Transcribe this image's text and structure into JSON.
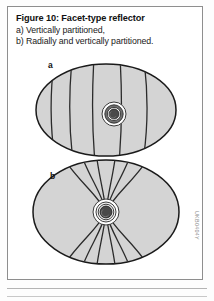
{
  "figure": {
    "title": "Figure 10: Facet-type reflector",
    "caption_lines": [
      "a) Vertically partitioned,",
      "b) Radially and vertically partitioned."
    ],
    "watermark_code": "UKB0404Y",
    "panels": [
      {
        "label": "a",
        "name": "vertically-partitioned-reflector",
        "description": "Elliptical dish reflector divided by vertical curved facet lines with a concentric circular hub at the center",
        "facet_line_count": 5,
        "partition_type": "vertical"
      },
      {
        "label": "b",
        "name": "radially-and-vertically-partitioned-reflector",
        "description": "Elliptical dish reflector with facet lines converging radially toward the concentric circular hub from above and below",
        "facet_line_count": 8,
        "partition_type": "radial-and-vertical"
      }
    ]
  },
  "colors": {
    "dish_fill": "#d4d4d4",
    "outline": "#1a1a1a",
    "facet_line": "#2b2b2b",
    "hub_ring_outer": "#ffffff",
    "hub_ring_mid": "#6e6e6e",
    "hub_ring_inner": "#ffffff",
    "hub_center": "#4a4a4a",
    "box_border": "#8e8e8e",
    "text": "#111111",
    "watermark": "#8a8a8a"
  }
}
